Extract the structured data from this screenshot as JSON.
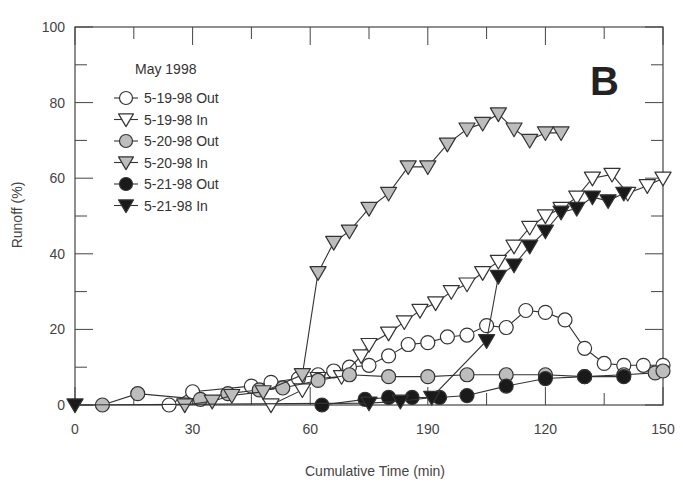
{
  "chart_data": {
    "type": "line",
    "title": "",
    "panel_label": "B",
    "xlabel": "Cumulative Time (min)",
    "ylabel": "Runoff (%)",
    "xlim": [
      0,
      150
    ],
    "ylim": [
      0,
      100
    ],
    "x_ticks": [
      0,
      30,
      60,
      90,
      120,
      150
    ],
    "x_tick_labels": [
      "0",
      "30",
      "60",
      "190",
      "120",
      "150"
    ],
    "y_ticks": [
      0,
      20,
      40,
      60,
      80,
      100
    ],
    "y_tick_labels": [
      "0",
      "20",
      "40",
      "60",
      "80",
      "100"
    ],
    "grid": false,
    "legend": {
      "title": "May 1998",
      "position": "upper-left"
    },
    "series": [
      {
        "name": "5-19-98 Out",
        "marker": "circle",
        "fill": "#ffffff",
        "points": [
          [
            24,
            0
          ],
          [
            30,
            3.5
          ],
          [
            45,
            5
          ],
          [
            50,
            6
          ],
          [
            57,
            7
          ],
          [
            62,
            8
          ],
          [
            66,
            9
          ],
          [
            70,
            10
          ],
          [
            75,
            10.5
          ],
          [
            80,
            13
          ],
          [
            85,
            16
          ],
          [
            90,
            16.5
          ],
          [
            95,
            18
          ],
          [
            100,
            18.5
          ],
          [
            105,
            21
          ],
          [
            110,
            20.5
          ],
          [
            115,
            25
          ],
          [
            120,
            24.5
          ],
          [
            125,
            22.5
          ],
          [
            130,
            15
          ],
          [
            135,
            11
          ],
          [
            140,
            10.5
          ],
          [
            145,
            10.5
          ],
          [
            150,
            10.5
          ]
        ]
      },
      {
        "name": "5-19-98 In",
        "marker": "triangle-down",
        "fill": "#ffffff",
        "points": [
          [
            50,
            0
          ],
          [
            58,
            4
          ],
          [
            62,
            7
          ],
          [
            68,
            7.5
          ],
          [
            73,
            13
          ],
          [
            75,
            16
          ],
          [
            80,
            19
          ],
          [
            84,
            22
          ],
          [
            88,
            25
          ],
          [
            92,
            27
          ],
          [
            96,
            30
          ],
          [
            100,
            32
          ],
          [
            104,
            35
          ],
          [
            108,
            38
          ],
          [
            112,
            42
          ],
          [
            116,
            47
          ],
          [
            120,
            50
          ],
          [
            124,
            52
          ],
          [
            128,
            55
          ],
          [
            132,
            60
          ],
          [
            137,
            61
          ],
          [
            141,
            56
          ],
          [
            146,
            58
          ],
          [
            150,
            60
          ]
        ]
      },
      {
        "name": "5-20-98 Out",
        "marker": "circle",
        "fill": "#bdbdbd",
        "points": [
          [
            7,
            0
          ],
          [
            16,
            3
          ],
          [
            32,
            1.5
          ],
          [
            39,
            3
          ],
          [
            47,
            4
          ],
          [
            53,
            4.5
          ],
          [
            62,
            6.5
          ],
          [
            70,
            8
          ],
          [
            80,
            7.5
          ],
          [
            90,
            7.5
          ],
          [
            100,
            8
          ],
          [
            110,
            8
          ],
          [
            120,
            8
          ],
          [
            130,
            7.5
          ],
          [
            140,
            8
          ],
          [
            148,
            8.5
          ],
          [
            150,
            9
          ]
        ]
      },
      {
        "name": "5-20-98 In",
        "marker": "triangle-down",
        "fill": "#bdbdbd",
        "points": [
          [
            28,
            0
          ],
          [
            35,
            1
          ],
          [
            40,
            2.5
          ],
          [
            48,
            3.5
          ],
          [
            58,
            8
          ],
          [
            62,
            35
          ],
          [
            66,
            43
          ],
          [
            70,
            46
          ],
          [
            75,
            52
          ],
          [
            80,
            56
          ],
          [
            85,
            63
          ],
          [
            90,
            63
          ],
          [
            95,
            69
          ],
          [
            100,
            73
          ],
          [
            104,
            74.5
          ],
          [
            108,
            77
          ],
          [
            112,
            73
          ],
          [
            116,
            70
          ],
          [
            120,
            72
          ],
          [
            124,
            72
          ]
        ]
      },
      {
        "name": "5-21-98 Out",
        "marker": "circle",
        "fill": "#1a1a1a",
        "points": [
          [
            63,
            0
          ],
          [
            74,
            1.5
          ],
          [
            80,
            2
          ],
          [
            86,
            2
          ],
          [
            93,
            2
          ],
          [
            100,
            2.5
          ],
          [
            110,
            5
          ],
          [
            120,
            7
          ],
          [
            130,
            7.5
          ],
          [
            140,
            7.5
          ]
        ]
      },
      {
        "name": "5-21-98 In",
        "marker": "triangle-down",
        "fill": "#1a1a1a",
        "points": [
          [
            0,
            0
          ],
          [
            75,
            0.5
          ],
          [
            83,
            1
          ],
          [
            91,
            2
          ],
          [
            105,
            17
          ],
          [
            108,
            34
          ],
          [
            112,
            37
          ],
          [
            116,
            42
          ],
          [
            120,
            46
          ],
          [
            124,
            51
          ],
          [
            128,
            52
          ],
          [
            132,
            55
          ],
          [
            136,
            54
          ],
          [
            140,
            56
          ]
        ]
      }
    ]
  },
  "colors": {
    "axis": "#444444",
    "line": "#333333",
    "stroke": "#333333"
  }
}
